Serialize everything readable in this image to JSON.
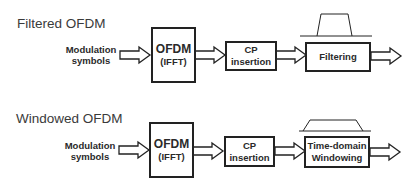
{
  "diagrams": [
    {
      "title": "Filtered OFDM",
      "input_label_line1": "Modulation",
      "input_label_line2": "symbols",
      "blocks": [
        {
          "line1": "OFDM",
          "line2": "(IFFT)"
        },
        {
          "line1": "CP",
          "line2": "insertion"
        },
        {
          "line1": "Filtering",
          "line2": ""
        }
      ],
      "shape_icon": "filter-frequency-response"
    },
    {
      "title": "Windowed OFDM",
      "input_label_line1": "Modulation",
      "input_label_line2": "symbols",
      "blocks": [
        {
          "line1": "OFDM",
          "line2": "(IFFT)"
        },
        {
          "line1": "CP",
          "line2": "insertion"
        },
        {
          "line1": "Time-domain",
          "line2": "Windowing"
        }
      ],
      "shape_icon": "time-window"
    }
  ],
  "colors": {
    "stroke": "#222222",
    "text": "#2a2a2a",
    "title": "#3a3a3a",
    "background": "#ffffff"
  }
}
